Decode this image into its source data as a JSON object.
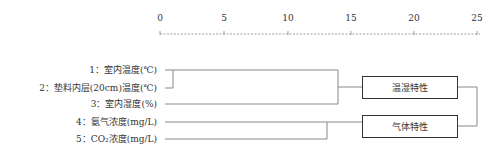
{
  "axis": {
    "ticks": [
      "0",
      "5",
      "10",
      "15",
      "20",
      "25"
    ]
  },
  "variables": [
    {
      "label": "1：室内温度(℃)"
    },
    {
      "label": "2：垫料内层(20cm)温度(℃)"
    },
    {
      "label": "3：室内湿度(%)"
    },
    {
      "label": "4：氨气浓度(mg/L)"
    },
    {
      "label": "5：CO₂浓度(mg/L)"
    }
  ],
  "clusters": [
    {
      "label": "温湿特性"
    },
    {
      "label": "气体特性"
    }
  ],
  "colors": {
    "line": "#888888",
    "box": "#333333",
    "text": "#333333"
  }
}
